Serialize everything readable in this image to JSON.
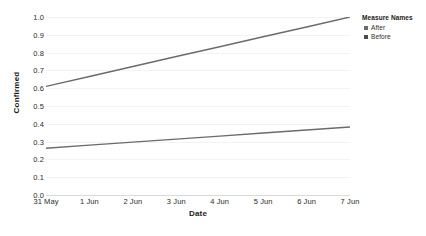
{
  "chart_data": {
    "type": "line",
    "title": "",
    "xlabel": "Date",
    "ylabel": "Confirmed",
    "x": [
      "31 May",
      "1 Jun",
      "2 Jun",
      "3 Jun",
      "4 Jun",
      "5 Jun",
      "6 Jun",
      "7 Jun"
    ],
    "ylim": [
      0.0,
      1.0
    ],
    "yticks": [
      "0.0",
      "0.1",
      "0.2",
      "0.3",
      "0.4",
      "0.5",
      "0.6",
      "0.7",
      "0.8",
      "0.9",
      "1.0"
    ],
    "ytick_values": [
      0.0,
      0.1,
      0.2,
      0.3,
      0.4,
      0.5,
      0.6,
      0.7,
      0.8,
      0.9,
      1.0
    ],
    "grid": true,
    "legend_position": "right",
    "series": [
      {
        "name": "After",
        "color": "#6b6b6b",
        "values": [
          0.61,
          0.666,
          0.722,
          0.778,
          0.833,
          0.889,
          0.944,
          1.0
        ]
      },
      {
        "name": "Before",
        "color": "#6b6b6b",
        "values": [
          0.263,
          0.28,
          0.297,
          0.314,
          0.331,
          0.348,
          0.365,
          0.382
        ]
      }
    ]
  },
  "legend": {
    "title": "Measure Names",
    "items": [
      {
        "label": "After",
        "color": "#6b6b6b"
      },
      {
        "label": "Before",
        "color": "#4a4a4a"
      }
    ]
  },
  "colors": {
    "gridline": "#f2f3f5",
    "axis": "#d9dbdf",
    "text": "#2b2b2b",
    "line": "#6b6b6b"
  }
}
